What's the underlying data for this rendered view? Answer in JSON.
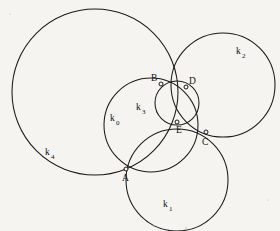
{
  "figure": {
    "background_color": "#f6f4f1",
    "stroke_color": "#1a1a1a",
    "width": 280,
    "height": 231
  },
  "chart_data": {
    "type": "diagram",
    "subtype": "euclidean-circle-configuration",
    "title": "",
    "xlabel": "",
    "ylabel": "",
    "xlim": [
      0,
      280
    ],
    "ylim": [
      0,
      231
    ],
    "grid": false,
    "legend": "none",
    "circles": [
      {
        "id": "k0",
        "label": "k",
        "subscript": "0",
        "cx": 151,
        "cy": 125,
        "r": 47,
        "label_x": 110,
        "label_y": 121,
        "passes_through": [
          "A",
          "B",
          "E"
        ]
      },
      {
        "id": "k1",
        "label": "k",
        "subscript": "1",
        "cx": 177,
        "cy": 180,
        "r": 51,
        "label_x": 163,
        "label_y": 207,
        "passes_through": [
          "A",
          "C",
          "E"
        ]
      },
      {
        "id": "k2",
        "label": "k",
        "subscript": "2",
        "cx": 223,
        "cy": 85,
        "r": 52,
        "label_x": 236,
        "label_y": 54,
        "passes_through": [
          "C",
          "D"
        ]
      },
      {
        "id": "k3",
        "label": "k",
        "subscript": "3",
        "cx": 177,
        "cy": 103,
        "r": 22,
        "label_x": 136,
        "label_y": 110,
        "passes_through": [
          "B",
          "D",
          "E"
        ]
      },
      {
        "id": "k4",
        "label": "k",
        "subscript": "4",
        "cx": 95,
        "cy": 92,
        "r": 83,
        "label_x": 45,
        "label_y": 155,
        "passes_through": [
          "A",
          "B",
          "D"
        ]
      }
    ],
    "points": [
      {
        "id": "A",
        "label": "A",
        "x": 126,
        "y": 169,
        "label_x": 122,
        "label_y": 181
      },
      {
        "id": "B",
        "label": "B",
        "x": 161,
        "y": 84,
        "label_x": 151,
        "label_y": 81
      },
      {
        "id": "C",
        "label": "C",
        "x": 206,
        "y": 132,
        "label_x": 202,
        "label_y": 145
      },
      {
        "id": "D",
        "label": "D",
        "x": 186,
        "y": 87,
        "label_x": 189,
        "label_y": 84
      },
      {
        "id": "E",
        "label": "E",
        "x": 177,
        "y": 122,
        "label_x": 176,
        "label_y": 133
      }
    ],
    "annotations": []
  }
}
